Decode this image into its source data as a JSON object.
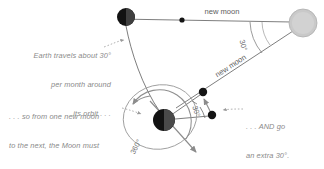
{
  "figure": {
    "background_color": "#ffffff",
    "line_color": "#6b6b6b",
    "annotation_color": "#8a8a8a",
    "label_color": "#5d5d5d"
  },
  "bodies": {
    "sun": {
      "name": "Sun",
      "fill": "#c9c9c9",
      "stroke": "#a8a8a8",
      "cx": 303,
      "cy": 23,
      "r": 14
    },
    "earth": {
      "name": "Earth",
      "fill": "#151515",
      "shade": "#4a4a4a",
      "cx": 164,
      "cy": 120,
      "r": 11
    },
    "moon_top": {
      "name": "Moon at first new moon",
      "fill": "#151515",
      "shade": "#3d3d3d",
      "cx": 126,
      "cy": 17,
      "r": 9
    },
    "moon_small_upper": {
      "name": "Moon after 360 degree orbit",
      "fill": "#151515",
      "cx": 203,
      "cy": 92,
      "r": 4
    },
    "moon_small_lower": {
      "name": "Moon at next new moon",
      "fill": "#151515",
      "cx": 212,
      "cy": 115,
      "r": 4
    }
  },
  "labels": {
    "new_moon_top": "new moon",
    "new_moon_diagonal": "new moon",
    "angle_sun": "30°",
    "angle_earth": "30°",
    "angle_orbit": "360°"
  },
  "annotations": {
    "earth_travels": {
      "lines": [
        "Earth travels about 30°",
        "per month around",
        "its orbit . . ."
      ],
      "align": "right"
    },
    "full_orbit": {
      "lines": [
        ". . . so from one new moon",
        "to the next, the Moon must",
        "complete a full 360° orbit . . ."
      ],
      "align": "left"
    },
    "extra_thirty": {
      "lines": [
        ". . . AND go",
        "an extra 30°."
      ],
      "align": "left"
    }
  }
}
